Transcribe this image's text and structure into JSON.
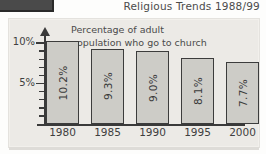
{
  "corner_mark": {
    "name": "cut-off-graphic"
  },
  "chart_data": {
    "type": "bar",
    "title": "Religious Trends 1988/99",
    "subtitle_line1": "Percentage of  adult",
    "subtitle_line2": "population who go to church",
    "xlabel": "",
    "ylabel": "",
    "categories": [
      "1980",
      "1985",
      "1990",
      "1995",
      "2000"
    ],
    "values": [
      10.2,
      9.3,
      9.0,
      8.1,
      7.7
    ],
    "value_labels": [
      "10.2%",
      "9.3%",
      "9.0%",
      "8.1%",
      "7.7%"
    ],
    "ylim": [
      0,
      11
    ],
    "ytick_labels": [
      "10%",
      "5%"
    ],
    "ytick_values": [
      10,
      5
    ],
    "minor_tick_values": [
      1,
      2,
      3,
      4,
      6,
      7,
      8,
      9
    ],
    "grid": false,
    "legend": null,
    "bar_color": "#cdccc7",
    "bar_edge_color": "#3c3c3c",
    "plot_background": "#eceae6",
    "axis_color": "#3a3a3a",
    "text_color": "#4b4b4b"
  }
}
